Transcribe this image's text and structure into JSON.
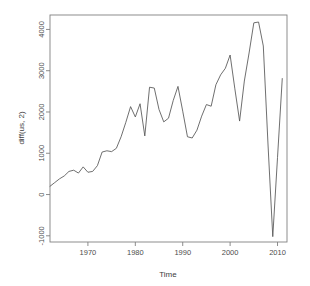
{
  "chart_data": {
    "type": "line",
    "title": "",
    "xlabel": "Time",
    "ylabel": "diff(us, 2)",
    "xlim": [
      1962,
      2012
    ],
    "ylim": [
      -1150,
      4350
    ],
    "xticks": [
      1970,
      1980,
      1990,
      2000,
      2010
    ],
    "xtick_labels": [
      "1970",
      "1980",
      "1990",
      "2000",
      "2010"
    ],
    "yticks": [
      -1000,
      0,
      1000,
      2000,
      3000,
      4000
    ],
    "ytick_labels": [
      "-1000",
      "0",
      "1000",
      "2000",
      "3000",
      "4000"
    ],
    "grid": false,
    "legend": false,
    "line_color": "#555555",
    "axis_color": "#808080",
    "background_color": "#ffffff",
    "x": [
      1962,
      1963,
      1964,
      1965,
      1966,
      1967,
      1968,
      1969,
      1970,
      1971,
      1972,
      1973,
      1974,
      1975,
      1976,
      1977,
      1978,
      1979,
      1980,
      1981,
      1982,
      1983,
      1984,
      1985,
      1986,
      1987,
      1988,
      1989,
      1990,
      1991,
      1992,
      1993,
      1994,
      1995,
      1996,
      1997,
      1998,
      1999,
      2000,
      2001,
      2002,
      2003,
      2004,
      2005,
      2006,
      2007,
      2008,
      2009,
      2010,
      2011
    ],
    "values": [
      200,
      290,
      380,
      450,
      560,
      590,
      520,
      670,
      540,
      560,
      700,
      1030,
      1060,
      1040,
      1120,
      1400,
      1750,
      2130,
      1880,
      2200,
      1420,
      2600,
      2580,
      2060,
      1760,
      1850,
      2280,
      2620,
      2020,
      1400,
      1370,
      1560,
      1900,
      2180,
      2140,
      2660,
      2900,
      3060,
      3380,
      2560,
      1780,
      2750,
      3430,
      4160,
      4180,
      3600,
      1200,
      -1020,
      900,
      2810
    ],
    "series": [
      {
        "name": "diff(us, 2)",
        "values": [
          200,
          290,
          380,
          450,
          560,
          590,
          520,
          670,
          540,
          560,
          700,
          1030,
          1060,
          1040,
          1120,
          1400,
          1750,
          2130,
          1880,
          2200,
          1420,
          2600,
          2580,
          2060,
          1760,
          1850,
          2280,
          2620,
          2020,
          1400,
          1370,
          1560,
          1900,
          2180,
          2140,
          2660,
          2900,
          3060,
          3380,
          2560,
          1780,
          2750,
          3430,
          4160,
          4180,
          3600,
          1200,
          -1020,
          900,
          2810
        ]
      }
    ]
  }
}
